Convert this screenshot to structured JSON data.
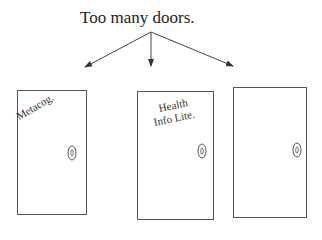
{
  "title": "Too many doors.",
  "doors": [
    {
      "label": "Metacog.",
      "x": 17,
      "y": 90,
      "w": 69,
      "h": 124,
      "knob": {
        "cx": 72,
        "cy": 153
      }
    },
    {
      "label_lines": [
        "Health",
        "Info Lite."
      ],
      "x": 137,
      "y": 91,
      "w": 76,
      "h": 128,
      "knob": {
        "cx": 202,
        "cy": 151
      }
    },
    {
      "label": "",
      "x": 233,
      "y": 87,
      "w": 73,
      "h": 130,
      "knob": {
        "cx": 297,
        "cy": 150
      }
    }
  ],
  "arrows": {
    "origin": {
      "x": 151,
      "y": 32
    },
    "targets": [
      {
        "x": 85,
        "y": 67
      },
      {
        "x": 150,
        "y": 66
      },
      {
        "x": 233,
        "y": 66
      }
    ]
  },
  "colors": {
    "stroke": "#555555",
    "text": "#222222"
  }
}
